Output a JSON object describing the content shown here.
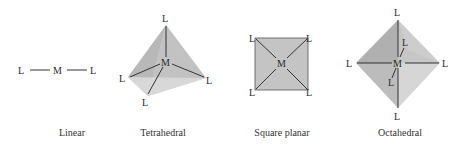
{
  "figure": {
    "geometries": [
      {
        "name": "Linear",
        "metal": "M",
        "ligand": "L",
        "ligand_count": 2
      },
      {
        "name": "Tetrahedral",
        "metal": "M",
        "ligand": "L",
        "ligand_count": 4
      },
      {
        "name": "Square planar",
        "metal": "M",
        "ligand": "L",
        "ligand_count": 4
      },
      {
        "name": "Octahedral",
        "metal": "M",
        "ligand": "L",
        "ligand_count": 6
      }
    ],
    "colors": {
      "shape_fill_light": "#d0d0d0",
      "shape_fill_mid": "#b8b8b8",
      "shape_fill_dark": "#a8a8a8",
      "bond_line": "#333333",
      "text": "#2a2a2a"
    }
  }
}
